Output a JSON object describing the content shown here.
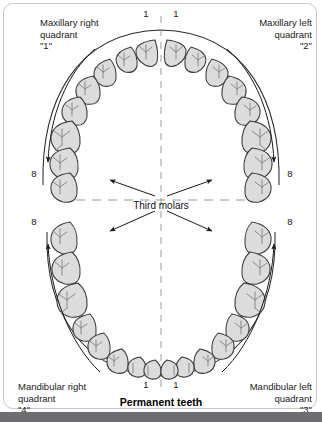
{
  "figure": {
    "caption": "Permanent teeth",
    "center_annotation": "Third molars",
    "quadrants": [
      {
        "id": "1",
        "name": "quadrant-1",
        "label": "Maxillary right\nquadrant\n\"1\"",
        "arch": "maxillary",
        "side": "right",
        "tooth_count": 8
      },
      {
        "id": "2",
        "name": "quadrant-2",
        "label": "Maxillary left\nquadrant\n\"2\"",
        "arch": "maxillary",
        "side": "left",
        "tooth_count": 8
      },
      {
        "id": "3",
        "name": "quadrant-3",
        "label": "Mandibular left\nquadrant\n\"3\"",
        "arch": "mandibular",
        "side": "left",
        "tooth_count": 8
      },
      {
        "id": "4",
        "name": "quadrant-4",
        "label": "Mandibular right\nquadrant\n\"4\"",
        "arch": "mandibular",
        "side": "right",
        "tooth_count": 8
      }
    ],
    "tooth_numbers": {
      "maxillary_right_central_incisor": "1",
      "maxillary_left_central_incisor": "1",
      "mandibular_right_central_incisor": "1",
      "mandibular_left_central_incisor": "1",
      "maxillary_right_third_molar": "8",
      "maxillary_left_third_molar": "8",
      "mandibular_right_third_molar": "8",
      "mandibular_left_third_molar": "8"
    },
    "total_teeth": 32,
    "colors": {
      "tooth_fill": "#dcdcdc",
      "tooth_outline": "#3a3a3a",
      "groove": "#8a8a8a",
      "arch_outline": "#2b2b2b",
      "midline_dash": "#9a9a9a",
      "text": "#1a1a1a",
      "frame": "#c8c8c8",
      "bottom_band": "#6e6e72"
    }
  }
}
